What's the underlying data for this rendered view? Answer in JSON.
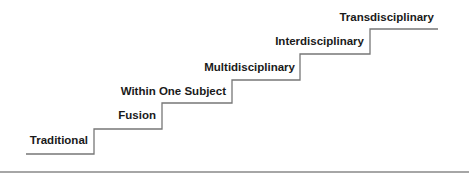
{
  "diagram": {
    "type": "staircase",
    "steps": [
      {
        "label": "Traditional"
      },
      {
        "label": "Fusion"
      },
      {
        "label": "Within One Subject"
      },
      {
        "label": "Multidisciplinary"
      },
      {
        "label": "Interdisciplinary"
      },
      {
        "label": "Transdisciplinary"
      }
    ],
    "colors": {
      "line": "#777777",
      "text": "#1a1a1a",
      "rule": "#888888"
    }
  }
}
